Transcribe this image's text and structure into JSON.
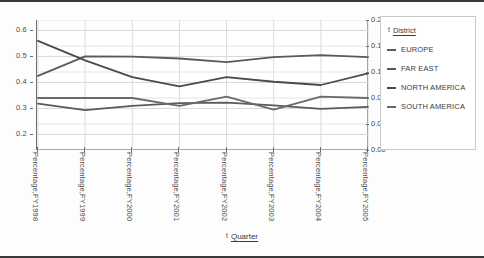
{
  "axes": {
    "left_ticks": [
      "0.6",
      "0.5",
      "0.4",
      "0.3",
      "0.2"
    ],
    "right_ticks": [
      "0.20",
      "0.16",
      "0.12",
      "0.08",
      "0.04",
      "0.00"
    ],
    "x_axis_title": "Quarter",
    "x_axis_pill": "t",
    "legend_pill": "t"
  },
  "legend": {
    "title": "District",
    "items": [
      {
        "label": "EUROPE",
        "color": "#5a5a5a"
      },
      {
        "label": "FAR EAST",
        "color": "#5a5a5a"
      },
      {
        "label": "NORTH AMERICA",
        "color": "#4a4a4a"
      },
      {
        "label": "SOUTH AMERICA",
        "color": "#6a6a6a"
      }
    ]
  },
  "chart_data": {
    "type": "line",
    "title": "",
    "xlabel": "Quarter",
    "ylabel": "",
    "grid": true,
    "legend_position": "right",
    "categories": [
      "Percentage,FY1998",
      "Percentage,FY1999",
      "Percentage,FY2000",
      "Percentage,FY2001",
      "Percentage,FY2002",
      "Percentage,FY2003",
      "Percentage,FY2004",
      "Percentage,FY2005"
    ],
    "left_axis": {
      "ticks": [
        0.2,
        0.3,
        0.4,
        0.5,
        0.6
      ],
      "ylim": [
        0.14,
        0.64
      ]
    },
    "right_axis": {
      "ticks": [
        0.0,
        0.04,
        0.08,
        0.12,
        0.16,
        0.2
      ],
      "ylim": [
        0.0,
        0.2
      ]
    },
    "series": [
      {
        "name": "EUROPE",
        "axis": "left",
        "color": "#5a5a5a",
        "values": [
          0.425,
          0.5,
          0.499,
          0.492,
          0.478,
          0.497,
          0.505,
          0.497
        ]
      },
      {
        "name": "FAR EAST",
        "axis": "left",
        "color": "#5a5a5a",
        "values": [
          0.318,
          0.293,
          0.31,
          0.32,
          0.322,
          0.312,
          0.298,
          0.306
        ]
      },
      {
        "name": "NORTH AMERICA",
        "axis": "right",
        "color": "#4a4a4a",
        "values": [
          0.168,
          0.138,
          0.112,
          0.098,
          0.112,
          0.105,
          0.1,
          0.118
        ]
      },
      {
        "name": "SOUTH AMERICA",
        "axis": "right",
        "color": "#6a6a6a",
        "values": [
          0.08,
          0.08,
          0.08,
          0.068,
          0.082,
          0.062,
          0.082,
          0.08
        ]
      }
    ]
  }
}
